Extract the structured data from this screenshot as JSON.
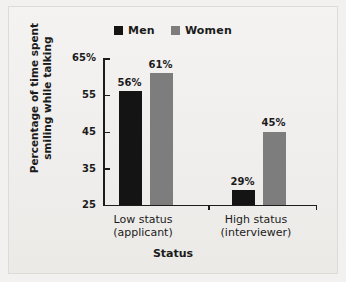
{
  "chart_data": {
    "type": "bar",
    "title": "",
    "categories": [
      "Low status\n(applicant)",
      "High status\n(interviewer)"
    ],
    "category_lines": [
      [
        "Low status",
        "(applicant)"
      ],
      [
        "High status",
        "(interviewer)"
      ]
    ],
    "series": [
      {
        "name": "Men",
        "color": "#141414",
        "values": [
          56,
          29
        ],
        "labels": [
          "56%",
          "29%"
        ]
      },
      {
        "name": "Women",
        "color": "#7d7d7d",
        "values": [
          61,
          45
        ],
        "labels": [
          "61%",
          "45%"
        ]
      }
    ],
    "xlabel": "Status",
    "ylabel": "Percentage of time spent smiling while talking",
    "ylabel_lines": [
      "Percentage of time spent",
      "smiling while talking"
    ],
    "ylim": [
      25,
      65
    ],
    "yticks": [
      65,
      55,
      45,
      35,
      25
    ],
    "ytick_labels": [
      "65%",
      "55",
      "45",
      "35",
      "25"
    ],
    "grid": false,
    "legend_position": "top-center"
  },
  "legend": {
    "entries": [
      {
        "label": "Men",
        "swatch": "black-square-swatch"
      },
      {
        "label": "Women",
        "swatch": "gray-square-swatch"
      }
    ]
  },
  "colors": {
    "men": "#141414",
    "women": "#7d7d7d",
    "axis": "#1c1c1c",
    "background": "#f2f1ef",
    "text": "#1b1b1b"
  }
}
